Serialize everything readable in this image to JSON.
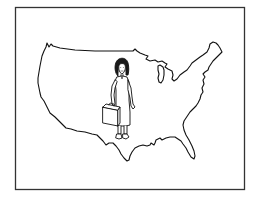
{
  "illustration": {
    "description": "Line drawing of a girl with a suitcase standing on an outline map of the United States",
    "frame": {
      "x": 15,
      "y": 7,
      "width": 230,
      "height": 183,
      "stroke": "#333333"
    },
    "map": {
      "subject": "us-map-outline",
      "stroke": "#111111",
      "fill": "#ffffff"
    },
    "figure": {
      "subject": "girl-with-suitcase",
      "stroke": "#111111",
      "hair": "#1a1a1a"
    }
  }
}
